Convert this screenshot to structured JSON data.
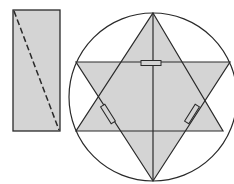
{
  "diagram": {
    "colors": {
      "fill": "#d4d4d4",
      "stroke": "#2a2a2a",
      "background": "#ffffff"
    },
    "rectangle": {
      "x": 13,
      "y": 10,
      "width": 47,
      "height": 121,
      "diagonal": {
        "x1": 14,
        "y1": 11,
        "x2": 59,
        "y2": 130,
        "style": "dashed"
      }
    },
    "circle": {
      "cx": 153,
      "cy": 97,
      "r": 84
    },
    "star": {
      "triangle_up": [
        [
          153,
          13
        ],
        [
          223,
          131
        ],
        [
          76,
          131
        ]
      ],
      "triangle_down": [
        [
          76,
          62
        ],
        [
          230,
          62
        ],
        [
          153,
          181
        ]
      ],
      "vertical_line": {
        "x1": 153,
        "y1": 13,
        "x2": 153,
        "y2": 181
      },
      "horizontal_lines": [
        {
          "x1": 76,
          "y1": 62,
          "x2": 230,
          "y2": 62
        },
        {
          "x1": 76,
          "y1": 131,
          "x2": 223,
          "y2": 131
        }
      ]
    },
    "small_rects": [
      {
        "cx": 151,
        "cy": 63,
        "w": 20,
        "h": 5,
        "angle": 0
      },
      {
        "cx": 108,
        "cy": 114,
        "w": 20,
        "h": 5,
        "angle": 58
      },
      {
        "cx": 192,
        "cy": 114,
        "w": 20,
        "h": 5,
        "angle": -58
      }
    ]
  }
}
